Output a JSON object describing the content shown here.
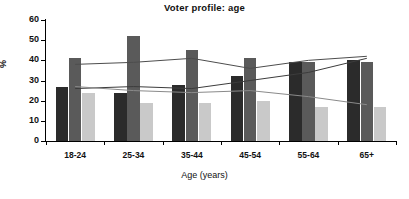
{
  "chart_data": {
    "type": "bar",
    "title": "Voter profile: age",
    "xlabel": "Age (years)",
    "ylabel": "%",
    "categories": [
      "18-24",
      "25-34",
      "35-44",
      "45-54",
      "55-64",
      "65+"
    ],
    "ylim": [
      0,
      60
    ],
    "yticks": [
      0,
      10,
      20,
      30,
      40,
      50,
      60
    ],
    "grid": false,
    "legend": "none",
    "series": [
      {
        "name": "series-1-dark",
        "type": "bar",
        "color": "#2b2b2b",
        "values": [
          27,
          24,
          28,
          32,
          39,
          40
        ]
      },
      {
        "name": "series-2-medium",
        "type": "bar",
        "color": "#5a5a5a",
        "values": [
          41,
          52,
          45,
          41,
          39,
          39
        ]
      },
      {
        "name": "series-3-light",
        "type": "bar",
        "color": "#c9c9c9",
        "values": [
          24,
          19,
          19,
          20,
          17,
          17
        ]
      },
      {
        "name": "line-1",
        "type": "line",
        "color": "#4d4d4d",
        "values": [
          38,
          39,
          41,
          36,
          40,
          42
        ]
      },
      {
        "name": "line-2",
        "type": "line",
        "color": "#3c3c3c",
        "values": [
          26,
          27,
          26,
          30,
          34,
          41
        ]
      },
      {
        "name": "line-3",
        "type": "line",
        "color": "#8a8a8a",
        "values": [
          27,
          25,
          24,
          25,
          22,
          18
        ]
      }
    ]
  }
}
